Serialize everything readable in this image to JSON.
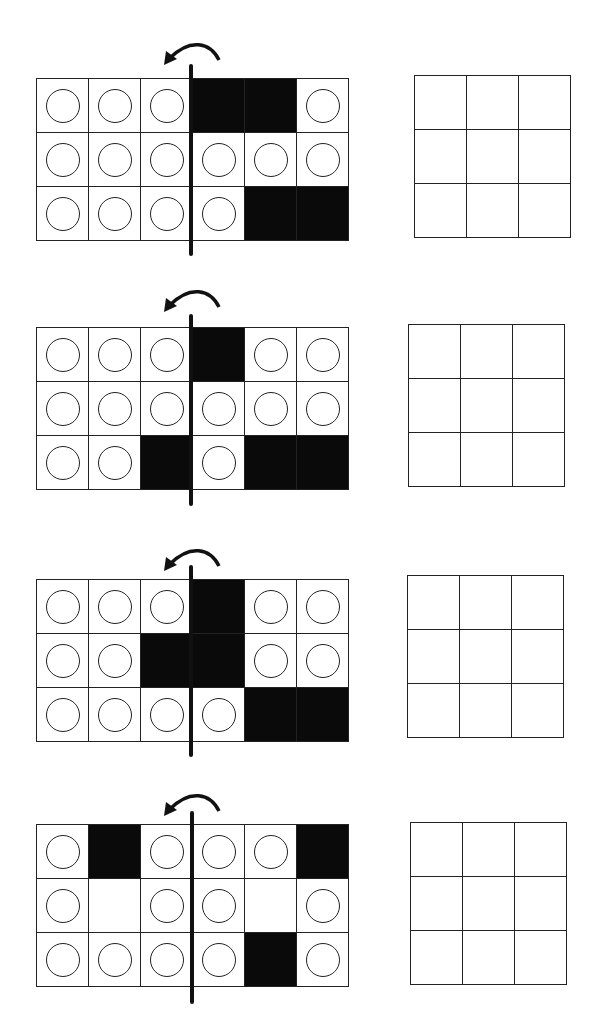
{
  "worksheet": {
    "instruction_icons": {
      "fold_arrow": "curved-arrow-left-icon",
      "fold_line": "vertical-fold-line"
    },
    "legend": {
      "O": "circle",
      "B": "black-filled",
      "E": "empty"
    },
    "colors": {
      "line": "#222222",
      "fill_black": "#0a0a0a",
      "background": "#ffffff"
    },
    "panels": [
      {
        "rows": [
          [
            "O",
            "O",
            "O",
            "B",
            "B",
            "O"
          ],
          [
            "O",
            "O",
            "O",
            "O",
            "O",
            "O"
          ],
          [
            "O",
            "O",
            "O",
            "O",
            "B",
            "B"
          ]
        ],
        "answer_grid": [
          [
            "",
            "",
            ""
          ],
          [
            "",
            "",
            ""
          ],
          [
            "",
            "",
            ""
          ]
        ]
      },
      {
        "rows": [
          [
            "O",
            "O",
            "O",
            "B",
            "O",
            "O"
          ],
          [
            "O",
            "O",
            "O",
            "O",
            "O",
            "O"
          ],
          [
            "O",
            "O",
            "B",
            "O",
            "B",
            "B"
          ]
        ],
        "answer_grid": [
          [
            "",
            "",
            ""
          ],
          [
            "",
            "",
            ""
          ],
          [
            "",
            "",
            ""
          ]
        ]
      },
      {
        "rows": [
          [
            "O",
            "O",
            "O",
            "B",
            "O",
            "O"
          ],
          [
            "O",
            "O",
            "B",
            "B",
            "O",
            "O"
          ],
          [
            "O",
            "O",
            "O",
            "O",
            "B",
            "B"
          ]
        ],
        "answer_grid": [
          [
            "",
            "",
            ""
          ],
          [
            "",
            "",
            ""
          ],
          [
            "",
            "",
            ""
          ]
        ]
      },
      {
        "rows": [
          [
            "O",
            "B",
            "O",
            "O",
            "O",
            "B"
          ],
          [
            "O",
            "E",
            "O",
            "O",
            "E",
            "O"
          ],
          [
            "O",
            "O",
            "O",
            "O",
            "B",
            "O"
          ]
        ],
        "answer_grid": [
          [
            "",
            "",
            ""
          ],
          [
            "",
            "",
            ""
          ],
          [
            "",
            "",
            ""
          ]
        ]
      }
    ]
  }
}
